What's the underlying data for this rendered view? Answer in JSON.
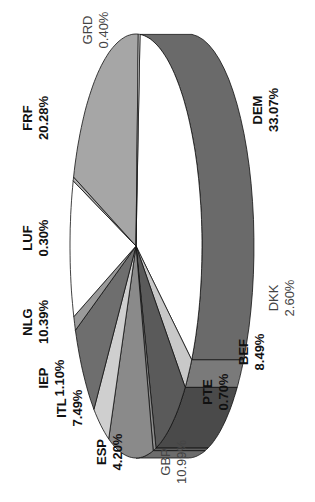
{
  "chart_data": {
    "type": "pie",
    "style": "3d-exploded-none, rotated 90deg counterclockwise",
    "title": "",
    "categories": [
      "DEM",
      "DKK",
      "BEF",
      "PTE",
      "GBP",
      "ESP",
      "ITL",
      "IEP",
      "NLG",
      "LUF",
      "FRF",
      "GRD"
    ],
    "values": [
      33.07,
      2.6,
      8.49,
      0.7,
      10.99,
      4.2,
      7.49,
      1.1,
      10.39,
      0.3,
      20.28,
      0.4
    ],
    "labels": [
      {
        "code": "DEM",
        "pct": "33.07%",
        "bold": true
      },
      {
        "code": "DKK",
        "pct": "2.60%",
        "bold": false
      },
      {
        "code": "BEF",
        "pct": "8.49%",
        "bold": true
      },
      {
        "code": "PTE",
        "pct": "0.70%",
        "bold": true
      },
      {
        "code": "GBP",
        "pct": "10.99%",
        "bold": false
      },
      {
        "code": "ESP",
        "pct": "4.20%",
        "bold": true
      },
      {
        "code": "ITL",
        "pct": "7.49%",
        "bold": true
      },
      {
        "code": "IEP",
        "pct": "1.10%",
        "bold": true
      },
      {
        "code": "NLG",
        "pct": "10.39%",
        "bold": true
      },
      {
        "code": "LUF",
        "pct": "0.30%",
        "bold": true
      },
      {
        "code": "FRF",
        "pct": "20.28%",
        "bold": true
      },
      {
        "code": "GRD",
        "pct": "0.40%",
        "bold": false
      }
    ],
    "colors": [
      "#ffffff",
      "#c8c8c8",
      "#5a5a5a",
      "#8c8c8c",
      "#8a8a8a",
      "#cfcfcf",
      "#6e6e6e",
      "#9a9a9a",
      "#ffffff",
      "#b0b0b0",
      "#a6a6a6",
      "#ffffff"
    ],
    "side_colors": [
      "#6a6a6a",
      "#7a7a7a",
      "#4a4a4a",
      "#5e5e5e",
      "#6c6c6c",
      "#9c9c9c",
      "#505050",
      "#707070",
      "#9a9a9a",
      "#808080",
      "#787878",
      "#9a9a9a"
    ],
    "legend": "none (labels placed around pie)",
    "grid": false
  }
}
